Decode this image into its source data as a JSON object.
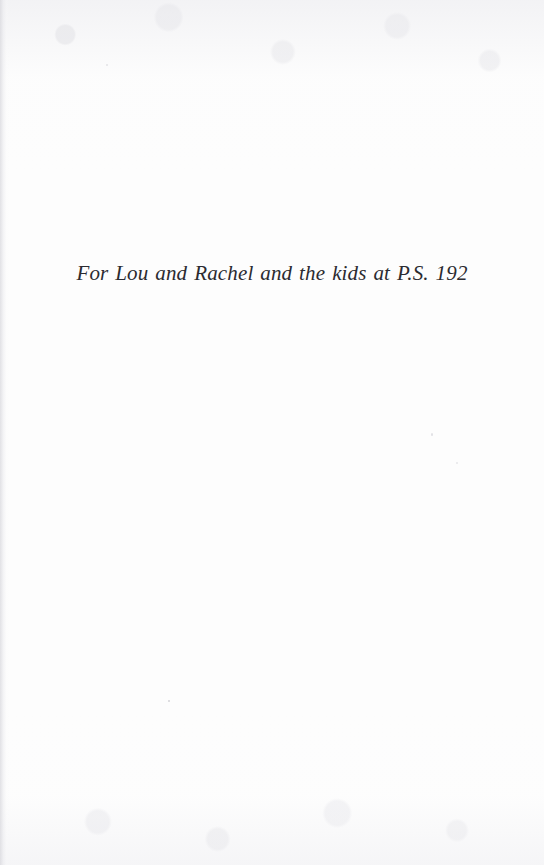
{
  "page": {
    "type": "book-dedication-page",
    "background_color": "#fdfdfd",
    "text_color": "#2b2b30"
  },
  "dedication": {
    "text": "For Lou and Rachel and the kids at P.S. 192"
  }
}
